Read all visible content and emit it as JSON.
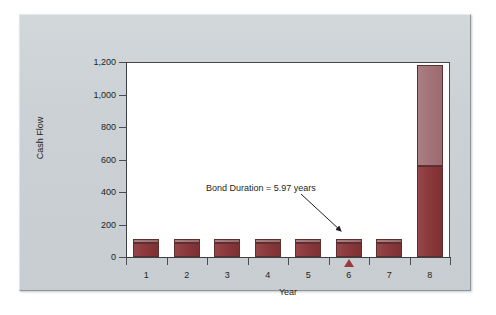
{
  "chart_data": {
    "type": "bar",
    "stacked": true,
    "title": "",
    "subtitle": "",
    "xlabel": "Year",
    "ylabel": "Cash Flow",
    "categories": [
      "1",
      "2",
      "3",
      "4",
      "5",
      "6",
      "7",
      "8"
    ],
    "ylim": [
      0,
      1200
    ],
    "ytick_labels": [
      "0",
      "200",
      "400",
      "600",
      "800",
      "1,000",
      "1,200"
    ],
    "ytick_values": [
      0,
      200,
      400,
      600,
      800,
      1000,
      1200
    ],
    "ytick_step": 200,
    "grid": false,
    "legend": "none",
    "series": [
      {
        "name": "Coupon / principal portion",
        "color": "#8e3b3e",
        "values": [
          86,
          86,
          86,
          86,
          86,
          86,
          86,
          560
        ]
      },
      {
        "name": "Present value weighting portion",
        "color": "#a4757a",
        "values": [
          24,
          24,
          24,
          24,
          24,
          24,
          24,
          620
        ]
      }
    ],
    "totals": [
      110,
      110,
      110,
      110,
      110,
      110,
      110,
      1180
    ],
    "annotations": [
      {
        "text": "Bond Duration = 5.97 years",
        "points_to_category": "6",
        "marker": "triangle-up"
      }
    ]
  },
  "axes": {
    "y_title": "Cash Flow",
    "x_title": "Year"
  },
  "annotation": {
    "label": "Bond Duration = 5.97 years"
  },
  "colors": {
    "panel_background": "#ccd2d5",
    "plot_background": "#ffffff",
    "axis": "#3c4042",
    "bar_lower": "#8e3b3e",
    "bar_upper": "#a4757a",
    "bar_outline": "#5d3030",
    "marker": "#9b3a3d",
    "text": "#1d1f21"
  }
}
